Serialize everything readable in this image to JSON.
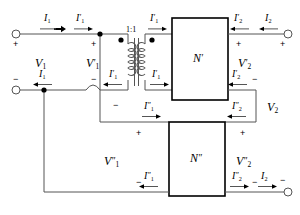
{
  "figure": {
    "type": "circuit-diagram",
    "stroke_color": "#555555",
    "box_stroke_color": "#000000",
    "text_color": "#000000",
    "background": "#ffffff"
  },
  "blocks": [
    {
      "id": "n-prime",
      "label": "N",
      "prime": "′",
      "name": "two-port-network-n-prime"
    },
    {
      "id": "n-double",
      "label": "N",
      "prime": "″",
      "name": "two-port-network-n-double-prime"
    }
  ],
  "transformer": {
    "ratio": "1:1",
    "name": "ideal-transformer",
    "dot_left": "dot-marker",
    "dot_right": "dot-marker"
  },
  "voltages": [
    {
      "id": "v1",
      "base": "V",
      "sub": "1",
      "prime": "",
      "text": "V₁",
      "name": "voltage-v1"
    },
    {
      "id": "v1-prime",
      "base": "V",
      "sub": "1",
      "prime": "′",
      "text": "V′₁",
      "name": "voltage-v1-prime"
    },
    {
      "id": "v1-dprime",
      "base": "V",
      "sub": "1",
      "prime": "″",
      "text": "V″₁",
      "name": "voltage-v1-double-prime"
    },
    {
      "id": "v2",
      "base": "V",
      "sub": "2",
      "prime": "",
      "text": "V₂",
      "name": "voltage-v2"
    },
    {
      "id": "v2-prime",
      "base": "V",
      "sub": "2",
      "prime": "′",
      "text": "V′₂",
      "name": "voltage-v2-prime"
    },
    {
      "id": "v2-dprime",
      "base": "V",
      "sub": "2",
      "prime": "″",
      "text": "V″₂",
      "name": "voltage-v2-double-prime"
    }
  ],
  "currents": [
    {
      "id": "i1-top",
      "base": "I",
      "sub": "1",
      "prime": "",
      "direction": "right",
      "name": "current-i1-top"
    },
    {
      "id": "i1-bottom",
      "base": "I",
      "sub": "1",
      "prime": "",
      "direction": "left",
      "name": "current-i1-bottom"
    },
    {
      "id": "i1p-top-left",
      "base": "I",
      "sub": "1",
      "prime": "′",
      "direction": "right",
      "name": "current-i1-prime-top-left"
    },
    {
      "id": "i1p-bottom-left",
      "base": "I",
      "sub": "1",
      "prime": "′",
      "direction": "left",
      "name": "current-i1-prime-bottom-left"
    },
    {
      "id": "i1p-top-right",
      "base": "I",
      "sub": "1",
      "prime": "′",
      "direction": "right",
      "name": "current-i1-prime-top-right"
    },
    {
      "id": "i1p-bot-right",
      "base": "I",
      "sub": "1",
      "prime": "′",
      "direction": "right",
      "name": "current-i1-prime-bottom-right"
    },
    {
      "id": "i2p-top",
      "base": "I",
      "sub": "2",
      "prime": "′",
      "direction": "left",
      "name": "current-i2-prime-top"
    },
    {
      "id": "i2p-bottom",
      "base": "I",
      "sub": "2",
      "prime": "′",
      "direction": "left",
      "name": "current-i2-prime-bottom"
    },
    {
      "id": "i2-top",
      "base": "I",
      "sub": "2",
      "prime": "",
      "direction": "left",
      "name": "current-i2-top"
    },
    {
      "id": "i1d-top",
      "base": "I",
      "sub": "1",
      "prime": "″",
      "direction": "right",
      "name": "current-i1-double-prime-top"
    },
    {
      "id": "i1d-bottom",
      "base": "I",
      "sub": "1",
      "prime": "″",
      "direction": "left",
      "name": "current-i1-double-prime-bottom"
    },
    {
      "id": "i2d-top",
      "base": "I",
      "sub": "2",
      "prime": "″",
      "direction": "left",
      "name": "current-i2-double-prime-top"
    },
    {
      "id": "i2d-bottom",
      "base": "I",
      "sub": "2",
      "prime": "″",
      "direction": "right",
      "name": "current-i2-double-prime-bottom"
    },
    {
      "id": "i2-bottom",
      "base": "I",
      "sub": "2",
      "prime": "",
      "direction": "right",
      "name": "current-i2-bottom"
    }
  ],
  "polarity_marks": {
    "plus": "+",
    "minus": "−",
    "items": [
      {
        "id": "p-v1-plus",
        "sign": "+",
        "name": "polarity-plus-v1"
      },
      {
        "id": "p-v1-minus",
        "sign": "−",
        "name": "polarity-minus-v1"
      },
      {
        "id": "p-v1p-plus",
        "sign": "+",
        "name": "polarity-plus-v1-prime"
      },
      {
        "id": "p-v1p-minus",
        "sign": "−",
        "name": "polarity-minus-v1-prime"
      },
      {
        "id": "p-v2p-plus",
        "sign": "+",
        "name": "polarity-plus-v2-prime"
      },
      {
        "id": "p-v2p-minus",
        "sign": "−",
        "name": "polarity-minus-v2-prime"
      },
      {
        "id": "p-v2-plus",
        "sign": "+",
        "name": "polarity-plus-v2"
      },
      {
        "id": "p-v2-minus",
        "sign": "−",
        "name": "polarity-minus-v2"
      },
      {
        "id": "p-v1d-plus",
        "sign": "+",
        "name": "polarity-plus-v1-double-prime"
      },
      {
        "id": "p-v1d-minus",
        "sign": "−",
        "name": "polarity-minus-v1-double-prime"
      },
      {
        "id": "p-v2d-plus",
        "sign": "+",
        "name": "polarity-plus-v2-double-prime"
      },
      {
        "id": "p-v2d-minus",
        "sign": "−",
        "name": "polarity-minus-v2-double-prime"
      },
      {
        "id": "p-upper-minus",
        "sign": "−",
        "name": "polarity-minus-upper-left-loop"
      }
    ]
  },
  "terminals": [
    {
      "id": "t-in-top",
      "name": "terminal-input-top"
    },
    {
      "id": "t-in-bot",
      "name": "terminal-input-bottom"
    },
    {
      "id": "t-out-top",
      "name": "terminal-output-top"
    },
    {
      "id": "t-out-bot",
      "name": "terminal-output-bottom"
    }
  ],
  "junctions": [
    {
      "id": "j-top",
      "name": "junction-node-top"
    },
    {
      "id": "j-bot",
      "name": "junction-node-bottom"
    }
  ]
}
